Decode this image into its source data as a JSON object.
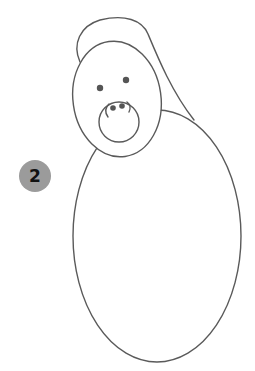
{
  "step": {
    "number": "2",
    "badge_color": "#9b9b9b",
    "text_color": "#111111"
  },
  "drawing": {
    "subject": "gorilla-outline",
    "line_color": "#5a5a5a",
    "parts": [
      "hood-back",
      "head",
      "eyes",
      "muzzle",
      "nostrils",
      "body"
    ]
  }
}
